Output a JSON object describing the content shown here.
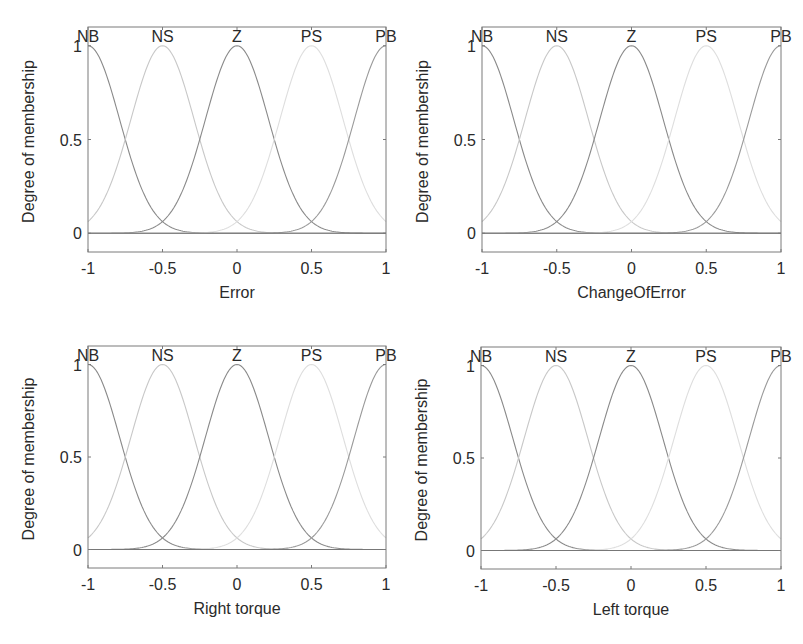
{
  "chart_data": [
    {
      "type": "line",
      "title": "",
      "xlabel": "Error",
      "ylabel": "Degree of membership",
      "xlim": [
        -1,
        1
      ],
      "ylim": [
        -0.1,
        1.1
      ],
      "xticks": [
        "-1",
        "-0.5",
        "0",
        "0.5",
        "1"
      ],
      "yticks": [
        "0",
        "0.5",
        "1"
      ],
      "grid": false,
      "mf_type": "gaussmf",
      "sigma": 0.2123,
      "series": [
        {
          "name": "NB",
          "center": -1,
          "color": "#8a8a8a"
        },
        {
          "name": "NS",
          "center": -0.5,
          "color": "#c8c8c8"
        },
        {
          "name": "Z",
          "center": 0,
          "color": "#8a8a8a"
        },
        {
          "name": "PS",
          "center": 0.5,
          "color": "#dedede"
        },
        {
          "name": "PB",
          "center": 1,
          "color": "#9a9a9a"
        }
      ],
      "box": {
        "left": 88,
        "top": 27,
        "right": 386,
        "bottom": 252
      }
    },
    {
      "type": "line",
      "title": "",
      "xlabel": "ChangeOfError",
      "ylabel": "Degree of membership",
      "xlim": [
        -1,
        1
      ],
      "ylim": [
        -0.1,
        1.1
      ],
      "xticks": [
        "-1",
        "-0.5",
        "0",
        "0.5",
        "1"
      ],
      "yticks": [
        "0",
        "0.5",
        "1"
      ],
      "grid": false,
      "mf_type": "gaussmf",
      "sigma": 0.2123,
      "series": [
        {
          "name": "NB",
          "center": -1,
          "color": "#8a8a8a"
        },
        {
          "name": "NS",
          "center": -0.5,
          "color": "#c8c8c8"
        },
        {
          "name": "Z",
          "center": 0,
          "color": "#8a8a8a"
        },
        {
          "name": "PS",
          "center": 0.5,
          "color": "#dedede"
        },
        {
          "name": "PB",
          "center": 1,
          "color": "#9a9a9a"
        }
      ],
      "box": {
        "left": 482,
        "top": 27,
        "right": 781,
        "bottom": 252
      }
    },
    {
      "type": "line",
      "title": "",
      "xlabel": "Right torque",
      "ylabel": "Degree of membership",
      "xlim": [
        -1,
        1
      ],
      "ylim": [
        -0.1,
        1.1
      ],
      "xticks": [
        "-1",
        "-0.5",
        "0",
        "0.5",
        "1"
      ],
      "yticks": [
        "0",
        "0.5",
        "1"
      ],
      "grid": false,
      "mf_type": "gaussmf",
      "sigma": 0.2123,
      "series": [
        {
          "name": "NB",
          "center": -1,
          "color": "#8a8a8a"
        },
        {
          "name": "NS",
          "center": -0.5,
          "color": "#c8c8c8"
        },
        {
          "name": "Z",
          "center": 0,
          "color": "#8a8a8a"
        },
        {
          "name": "PS",
          "center": 0.5,
          "color": "#dedede"
        },
        {
          "name": "PB",
          "center": 1,
          "color": "#9a9a9a"
        }
      ],
      "box": {
        "left": 88,
        "top": 346,
        "right": 386,
        "bottom": 568
      }
    },
    {
      "type": "line",
      "title": "",
      "xlabel": "Left torque",
      "ylabel": "Degree of membership",
      "xlim": [
        -1,
        1
      ],
      "ylim": [
        -0.1,
        1.1
      ],
      "xticks": [
        "-1",
        "-0.5",
        "0",
        "0.5",
        "1"
      ],
      "yticks": [
        "0",
        "0.5",
        "1"
      ],
      "grid": false,
      "mf_type": "gaussmf",
      "sigma": 0.2123,
      "series": [
        {
          "name": "NB",
          "center": -1,
          "color": "#8a8a8a"
        },
        {
          "name": "NS",
          "center": -0.5,
          "color": "#c8c8c8"
        },
        {
          "name": "Z",
          "center": 0,
          "color": "#8a8a8a"
        },
        {
          "name": "PS",
          "center": 0.5,
          "color": "#dedede"
        },
        {
          "name": "PB",
          "center": 1,
          "color": "#9a9a9a"
        }
      ],
      "box": {
        "left": 481,
        "top": 347,
        "right": 781,
        "bottom": 569
      }
    }
  ],
  "style": {
    "axis_color": "#7a7a7a",
    "zero_line_color": "#777777",
    "text_color": "#2a2a2a"
  }
}
